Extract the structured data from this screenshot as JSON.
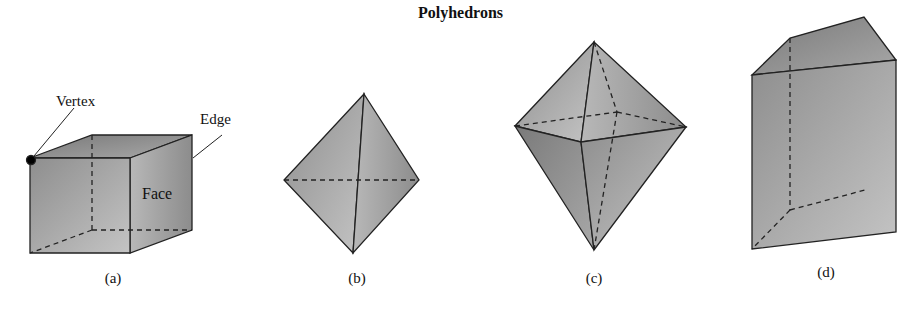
{
  "title": "Polyhedrons",
  "figures": [
    {
      "id": "a",
      "caption": "(a)",
      "shape": "cube",
      "annotations": {
        "vertex": "Vertex",
        "edge": "Edge",
        "face": "Face"
      }
    },
    {
      "id": "b",
      "caption": "(b)",
      "shape": "tetrahedron"
    },
    {
      "id": "c",
      "caption": "(c)",
      "shape": "octahedron"
    },
    {
      "id": "d",
      "caption": "(d)",
      "shape": "pentagonal prism"
    }
  ],
  "colors": {
    "face_dark": "#8a8a8a",
    "face_light": "#c8c8c8",
    "edge": "#222222"
  }
}
